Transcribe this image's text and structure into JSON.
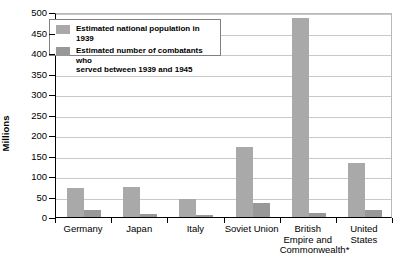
{
  "chart_data": {
    "type": "bar",
    "title": "",
    "xlabel": "",
    "ylabel": "Millions",
    "ylim": [
      0,
      500
    ],
    "ytick_step": 50,
    "grid": true,
    "legend_position": "top-left inside plot",
    "categories": [
      "Germany",
      "Japan",
      "Italy",
      "Soviet Union",
      "British\nEmpire and\nCommonwealth*",
      "United States"
    ],
    "series": [
      {
        "name": "Estimated national population in 1939",
        "color": "#a9a9a9",
        "values": [
          70,
          72,
          45,
          170,
          485,
          131
        ]
      },
      {
        "name": "Estimated number of combatants who served between 1939 and 1945",
        "color": "#989898",
        "values": [
          18,
          8,
          4,
          34,
          10,
          16
        ]
      }
    ],
    "ytick_labels": [
      "0",
      "50",
      "100",
      "150",
      "200",
      "250",
      "300",
      "350",
      "400",
      "450",
      "500"
    ]
  },
  "axes": {
    "y_title": "Millions"
  },
  "legend": {
    "entries": [
      {
        "label": "Estimated national population in 1939"
      },
      {
        "label": "Estimated number of combatants who\nserved between 1939 and 1945"
      }
    ]
  }
}
